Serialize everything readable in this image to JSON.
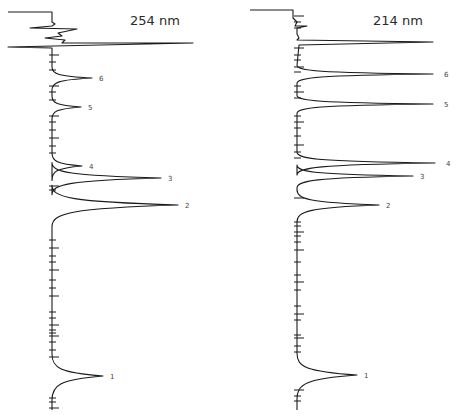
{
  "chart_data": [
    {
      "type": "line",
      "title": "254 nm",
      "orientation": "vertical-time-axis",
      "xlabel": "",
      "ylabel": "",
      "baseline_x": 52,
      "solvent_front": {
        "y": 43,
        "tip_x": 193
      },
      "peaks": [
        {
          "label": "6",
          "y": 78,
          "tip_x": 92,
          "width": 5
        },
        {
          "label": "5",
          "y": 107,
          "tip_x": 81,
          "width": 5
        },
        {
          "label": "4",
          "y": 166,
          "tip_x": 82,
          "width": 6
        },
        {
          "label": "3",
          "y": 178,
          "tip_x": 161,
          "width": 7
        },
        {
          "label": "2",
          "y": 205,
          "tip_x": 178,
          "width": 9
        },
        {
          "label": "1",
          "y": 376,
          "tip_x": 103,
          "width": 10
        }
      ],
      "ticks_y": [
        55,
        62,
        70,
        86,
        92,
        100,
        116,
        122,
        130,
        138,
        146,
        153,
        186,
        190,
        240,
        248,
        256,
        262,
        270,
        280,
        288,
        296,
        312,
        318,
        325,
        330,
        333,
        336,
        342,
        350,
        357,
        398,
        402,
        408
      ]
    },
    {
      "type": "line",
      "title": "214 nm",
      "orientation": "vertical-time-axis",
      "xlabel": "",
      "ylabel": "",
      "baseline_x": 297,
      "solvent_front": {
        "y": 42,
        "tip_x": 433
      },
      "peaks": [
        {
          "label": "6",
          "y": 74,
          "tip_x": 433,
          "width": 4
        },
        {
          "label": "5",
          "y": 104,
          "tip_x": 433,
          "width": 4
        },
        {
          "label": "4",
          "y": 163,
          "tip_x": 435,
          "width": 5
        },
        {
          "label": "3",
          "y": 176,
          "tip_x": 413,
          "width": 5
        },
        {
          "label": "2",
          "y": 205,
          "tip_x": 379,
          "width": 7
        },
        {
          "label": "1",
          "y": 375,
          "tip_x": 357,
          "width": 10
        }
      ],
      "ticks_y": [
        16,
        22,
        28,
        48,
        55,
        60,
        67,
        72,
        86,
        92,
        98,
        116,
        122,
        128,
        136,
        145,
        152,
        158,
        198,
        222,
        226,
        232,
        236,
        242,
        250,
        262,
        275,
        282,
        290,
        306,
        314,
        320,
        335,
        338,
        346,
        352,
        390,
        396,
        401
      ]
    }
  ],
  "panels": {
    "left": {
      "title": "254 nm"
    },
    "right": {
      "title": "214 nm"
    }
  }
}
